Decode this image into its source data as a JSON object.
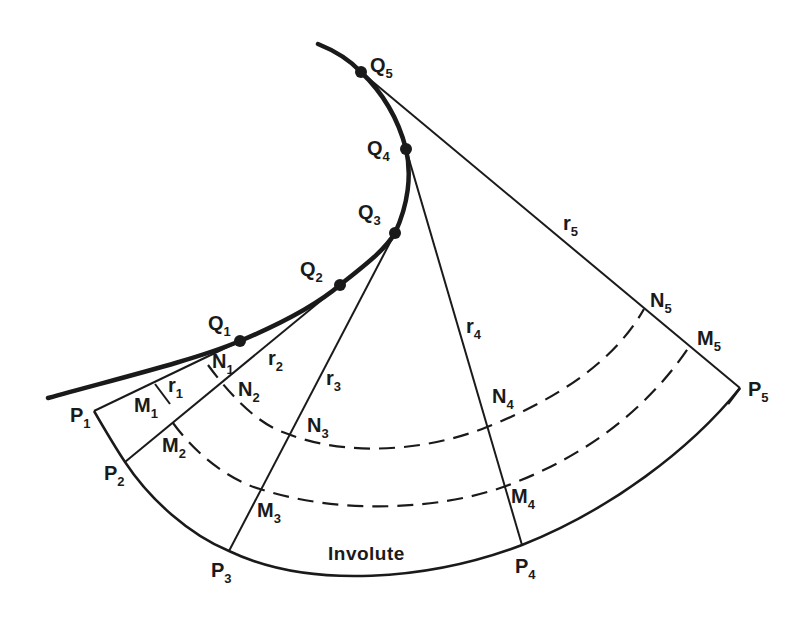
{
  "figure": {
    "type": "involute-construction",
    "caption_label": "Involute",
    "evolute_points": [
      {
        "name": "Q",
        "sub": "1",
        "x": 240,
        "y": 341
      },
      {
        "name": "Q",
        "sub": "2",
        "x": 340,
        "y": 285
      },
      {
        "name": "Q",
        "sub": "3",
        "x": 395,
        "y": 233
      },
      {
        "name": "Q",
        "sub": "4",
        "x": 406,
        "y": 149
      },
      {
        "name": "Q",
        "sub": "5",
        "x": 361,
        "y": 72
      }
    ],
    "involute_points": [
      {
        "name": "P",
        "sub": "1",
        "x": 94,
        "y": 411
      },
      {
        "name": "P",
        "sub": "2",
        "x": 125,
        "y": 462
      },
      {
        "name": "P",
        "sub": "3",
        "x": 229,
        "y": 551
      },
      {
        "name": "P",
        "sub": "4",
        "x": 522,
        "y": 545
      },
      {
        "name": "P",
        "sub": "5",
        "x": 740,
        "y": 388
      }
    ],
    "m_points": [
      {
        "name": "M",
        "sub": "1"
      },
      {
        "name": "M",
        "sub": "2"
      },
      {
        "name": "M",
        "sub": "3"
      },
      {
        "name": "M",
        "sub": "4"
      },
      {
        "name": "M",
        "sub": "5"
      }
    ],
    "n_points": [
      {
        "name": "N",
        "sub": "1"
      },
      {
        "name": "N",
        "sub": "2"
      },
      {
        "name": "N",
        "sub": "3"
      },
      {
        "name": "N",
        "sub": "4"
      },
      {
        "name": "N",
        "sub": "5"
      }
    ],
    "radii": [
      {
        "name": "r",
        "sub": "1"
      },
      {
        "name": "r",
        "sub": "2"
      },
      {
        "name": "r",
        "sub": "3"
      },
      {
        "name": "r",
        "sub": "4"
      },
      {
        "name": "r",
        "sub": "5"
      }
    ],
    "colors": {
      "ink": "#1a1a1a",
      "background": "#ffffff"
    }
  }
}
